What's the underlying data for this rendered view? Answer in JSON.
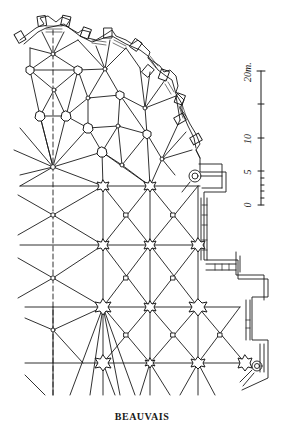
{
  "caption": "BEAUVAIS",
  "scale": {
    "unit": "m",
    "labels": [
      {
        "value": "0",
        "y": 204
      },
      {
        "value": "5",
        "y": 172
      },
      {
        "value": "10",
        "y": 139
      },
      {
        "value": "20m.",
        "y": 74
      }
    ],
    "ticks_major": [
      0,
      5,
      10,
      15,
      20
    ],
    "ticks_minor": [
      1,
      2,
      3,
      4
    ]
  },
  "colors": {
    "ink": "#1a1a1a",
    "background": "#ffffff"
  }
}
